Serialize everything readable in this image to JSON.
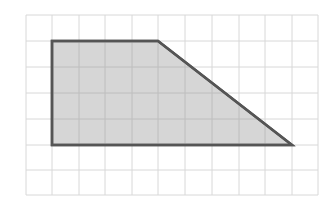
{
  "diagram": {
    "type": "trapezoid-on-grid",
    "grid": {
      "columns": 11,
      "rows": 7,
      "x_lines": [
        26,
        52,
        79,
        105,
        132,
        158,
        185,
        212,
        239,
        265,
        292,
        318
      ],
      "y_lines": [
        15,
        41,
        67,
        93,
        119,
        145,
        170,
        195
      ],
      "line_color": "#d8d8d8"
    },
    "shape": {
      "name": "trapezoid",
      "vertices_grid_units": [
        [
          1,
          1
        ],
        [
          5,
          1
        ],
        [
          10,
          5
        ],
        [
          1,
          5
        ]
      ],
      "vertices_px": [
        [
          52,
          41
        ],
        [
          158,
          41
        ],
        [
          292,
          145
        ],
        [
          52,
          145
        ]
      ],
      "top_base_units": 4,
      "bottom_base_units": 9,
      "height_units": 4,
      "fill_color": "#cfcfcf",
      "stroke_color": "#555555"
    }
  }
}
